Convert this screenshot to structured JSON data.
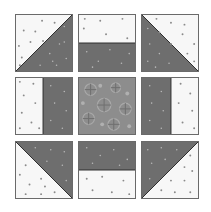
{
  "image": {
    "description": "Nine-patch quilt block diagram",
    "grid": {
      "rows": 3,
      "cols": 3
    }
  },
  "colors": {
    "light_fabric": "#f7f7f7",
    "light_dot": "#8a8a8a",
    "dark_fabric": "#6e6e6e",
    "dark_dot": "#b8b8b8",
    "center_fabric": "#8d8d8d",
    "border": "#5a5a5a"
  },
  "blocks": [
    {
      "id": "top-left",
      "type": "half-square-triangle",
      "dark": "bottom-right"
    },
    {
      "id": "top-middle",
      "type": "two-rectangles-horizontal",
      "dark": "bottom"
    },
    {
      "id": "top-right",
      "type": "half-square-triangle",
      "dark": "bottom-left"
    },
    {
      "id": "middle-left",
      "type": "two-rectangles-vertical",
      "dark": "right"
    },
    {
      "id": "center",
      "type": "floral-print"
    },
    {
      "id": "middle-right",
      "type": "two-rectangles-vertical",
      "dark": "left"
    },
    {
      "id": "bottom-left",
      "type": "half-square-triangle",
      "dark": "top-right"
    },
    {
      "id": "bottom-middle",
      "type": "two-rectangles-horizontal",
      "dark": "top"
    },
    {
      "id": "bottom-right",
      "type": "half-square-triangle",
      "dark": "top-left"
    }
  ]
}
